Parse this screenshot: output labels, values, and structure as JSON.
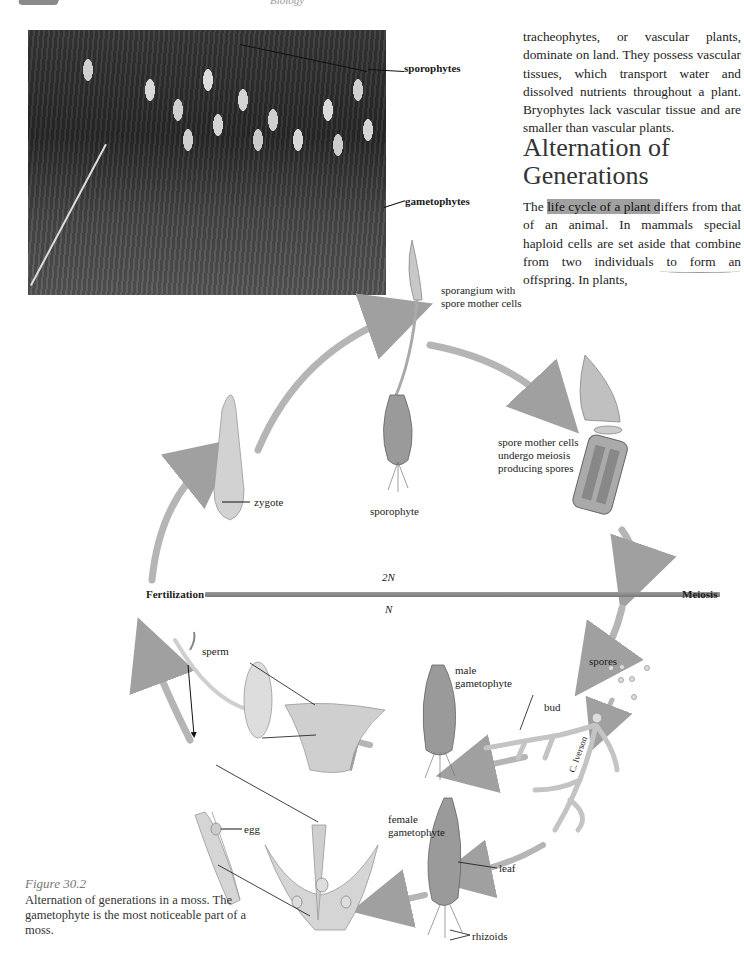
{
  "page": {
    "running_head": "Biology"
  },
  "photo": {
    "labels": {
      "sporophytes": "sporophytes",
      "gametophytes": "gametophytes"
    }
  },
  "text": {
    "paragraph1": "tracheophytes, or vascular plants, dominate on land. They possess vascular tissues, which transport water and dissolved nutrients throughout a plant. Bryophytes lack vascular tissue and are smaller than vascular plants.",
    "section_heading": "Alternation of Generations",
    "paragraph2_before": "The ",
    "paragraph2_highlight": "life cycle of a plant d",
    "paragraph2_after": "iffers from that of an animal. In mammals special haploid cells are set aside that combine from two individuals to form an offspring. In plants,"
  },
  "diagram": {
    "labels": {
      "sporangium": "sporangium with\nspore mother cells",
      "spore_mother_cells": "spore mother cells\nundergo meiosis\nproducing spores",
      "sporophyte": "sporophyte",
      "zygote": "zygote",
      "fertilization": "Fertilization",
      "meiosis": "Meiosis",
      "diploid": "2N",
      "haploid": "N",
      "sperm": "sperm",
      "male_gametophyte": "male\ngametophyte",
      "spores": "spores",
      "bud": "bud",
      "artist_credit": "C. Iverson",
      "female_gametophyte": "female\ngametophyte",
      "egg": "egg",
      "leaf": "leaf",
      "rhizoids": "rhizoids"
    }
  },
  "caption": {
    "figure_number": "Figure 30.2",
    "text": "Alternation of generations in a moss. The gametophyte is the most noticeable part of a moss."
  }
}
